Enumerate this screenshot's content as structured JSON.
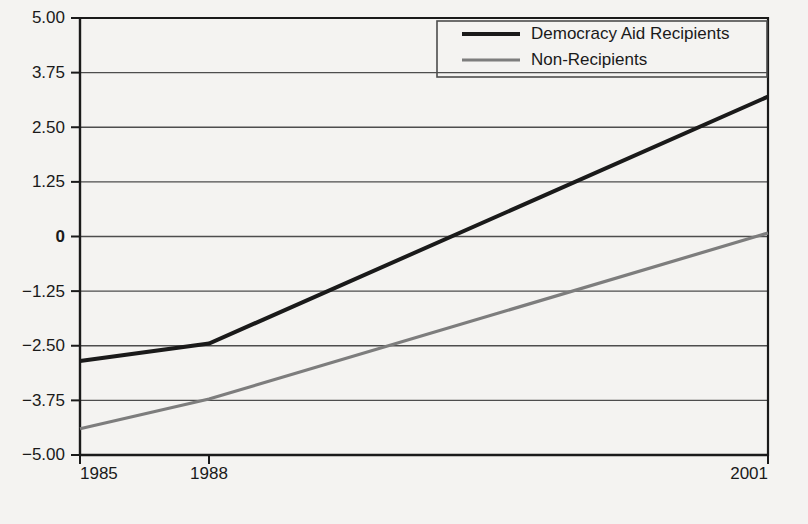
{
  "chart_data": {
    "type": "line",
    "title": "",
    "xlabel": "",
    "ylabel": "",
    "x": [
      1985,
      1988,
      2001
    ],
    "categories": [
      "1985",
      "1988",
      "2001"
    ],
    "xtick_labels": [
      "1985",
      "1988",
      "2001"
    ],
    "ytick_labels": [
      "5.00",
      "3.75",
      "2.50",
      "1.25",
      "0",
      "-1.25",
      "-2.50",
      "-3.75",
      "-5.00"
    ],
    "ytick_values": [
      5.0,
      3.75,
      2.5,
      1.25,
      0,
      -1.25,
      -2.5,
      -3.75,
      -5.0
    ],
    "ylim": [
      -5.0,
      5.0
    ],
    "xlim": [
      1985,
      2001
    ],
    "grid": true,
    "legend_position": "top-right",
    "series": [
      {
        "name": "Democracy Aid Recipients",
        "color": "#1a1a1a",
        "values": [
          -2.85,
          -2.45,
          3.2
        ]
      },
      {
        "name": "Non-Recipients",
        "color": "#7d7d7d",
        "values": [
          -4.4,
          -3.72,
          0.08
        ]
      }
    ]
  },
  "legend": {
    "entries": [
      {
        "label": "Democracy Aid Recipients",
        "color": "#1a1a1a",
        "width": 4
      },
      {
        "label": "Non-Recipients",
        "color": "#7d7d7d",
        "width": 3.2
      }
    ]
  },
  "axes": {
    "y_labels": [
      {
        "text": "5.00",
        "value": 5.0,
        "bold": false
      },
      {
        "text": "3.75",
        "value": 3.75,
        "bold": false
      },
      {
        "text": "2.50",
        "value": 2.5,
        "bold": false
      },
      {
        "text": "1.25",
        "value": 1.25,
        "bold": false
      },
      {
        "text": "0",
        "value": 0,
        "bold": true
      },
      {
        "text": "−1.25",
        "value": -1.25,
        "bold": false
      },
      {
        "text": "−2.50",
        "value": -2.5,
        "bold": false
      },
      {
        "text": "−3.75",
        "value": -3.75,
        "bold": false
      },
      {
        "text": "−5.00",
        "value": -5.0,
        "bold": false
      }
    ],
    "x_labels": [
      {
        "text": "1985",
        "value": 1985,
        "anchor": "start"
      },
      {
        "text": "1988",
        "value": 1988,
        "anchor": "middle"
      },
      {
        "text": "2001",
        "value": 2001,
        "anchor": "end"
      }
    ]
  },
  "colors": {
    "background": "#f4f3f1",
    "axis": "#1a1a1a",
    "grid": "#4d4d4d",
    "series_primary": "#1a1a1a",
    "series_secondary": "#7d7d7d",
    "text": "#1a1a1a",
    "legend_border": "#4d4d4d"
  }
}
